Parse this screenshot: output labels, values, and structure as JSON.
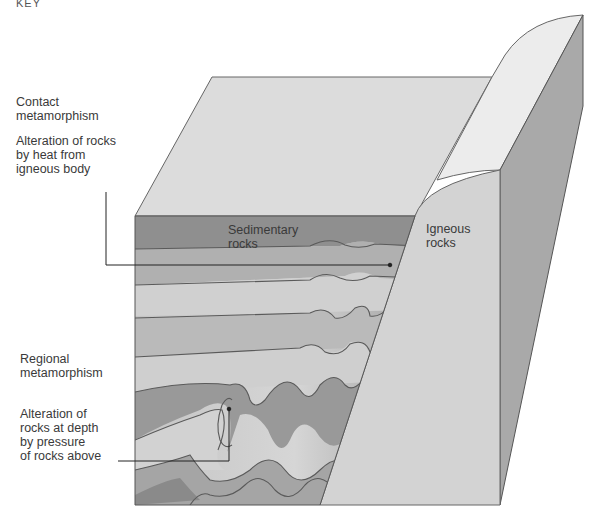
{
  "key": {
    "title": "KEY"
  },
  "legend": {
    "contact": {
      "heading": "Contact\nmetamorphism",
      "description": "Alteration of rocks\nby heat from\nigneous body"
    },
    "regional": {
      "heading": "Regional\nmetamorphism",
      "description": "Alteration of\nrocks at depth\nby pressure\nof rocks above"
    }
  },
  "block_labels": {
    "sedimentary": "Sedimentary\nrocks",
    "igneous": "Igneous\nrocks"
  },
  "colors": {
    "top_face": "#dcdcdc",
    "sediment_dark": "#8f8f8f",
    "sediment_mid": "#b5b5b5",
    "sediment_light": "#d8d8d8",
    "igneous_front": "#d4d4d4",
    "igneous_top": "#ececec",
    "side_face": "#a8a8a8",
    "outline": "#555555"
  }
}
